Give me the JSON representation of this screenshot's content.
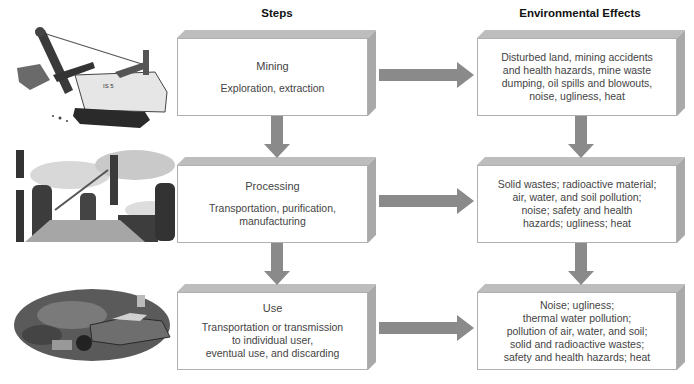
{
  "headers": {
    "steps": "Steps",
    "effects": "Environmental Effects"
  },
  "rows": [
    {
      "illustration": "power-shovel-excavator",
      "step": {
        "title": "Mining",
        "desc": [
          "Exploration, extraction"
        ]
      },
      "effects": [
        "Disturbed land, mining accidents",
        "and health hazards, mine waste",
        "dumping, oil spills and blowouts,",
        "noise, ugliness, heat"
      ]
    },
    {
      "illustration": "industrial-smokestacks",
      "step": {
        "title": "Processing",
        "desc": [
          "Transportation, purification,",
          "manufacturing"
        ]
      },
      "effects": [
        "Solid wastes; radioactive material;",
        "air, water, and soil pollution;",
        "noise; safety and health",
        "hazards; ugliness; heat"
      ]
    },
    {
      "illustration": "junkyard-scrap-cars",
      "step": {
        "title": "Use",
        "desc": [
          "Transportation or transmission",
          "to individual user,",
          "eventual use, and discarding"
        ]
      },
      "effects": [
        "Noise; ugliness;",
        "thermal water pollution;",
        "pollution of air, water, and soil;",
        "solid and radioactive wastes;",
        "safety and health hazards; heat"
      ]
    }
  ],
  "colors": {
    "arrow": "#8a8a8a",
    "box_top": "#bdbdbd",
    "box_side": "#a9a9a9",
    "box_border": "#b0b0b0"
  }
}
